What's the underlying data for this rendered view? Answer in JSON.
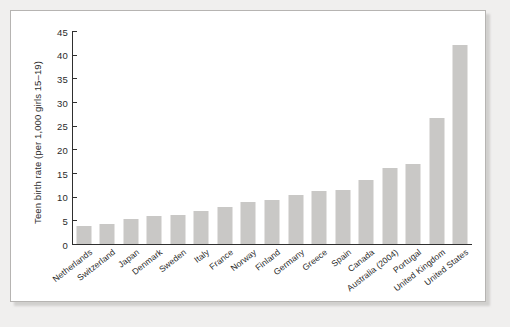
{
  "chart_data": {
    "type": "bar",
    "title": "",
    "xlabel": "",
    "ylabel": "Teen birth rate (per 1,000 girls 15–19)",
    "ylim": [
      0,
      45
    ],
    "yticks": [
      0,
      5,
      10,
      15,
      20,
      25,
      30,
      35,
      40,
      45
    ],
    "grid": false,
    "legend": null,
    "bar_color": "#c9c8c6",
    "categories": [
      "Netherlands",
      "Switzerland",
      "Japan",
      "Denmark",
      "Sweden",
      "Italy",
      "France",
      "Norway",
      "Finland",
      "Germany",
      "Greece",
      "Spain",
      "Canada",
      "Australia (2004)",
      "Portugal",
      "United Kingdom",
      "United States"
    ],
    "values": [
      3.8,
      4.3,
      5.2,
      5.9,
      6.2,
      7.0,
      7.8,
      8.8,
      9.2,
      10.4,
      11.2,
      11.5,
      13.5,
      16.0,
      16.9,
      26.7,
      42.0
    ]
  }
}
